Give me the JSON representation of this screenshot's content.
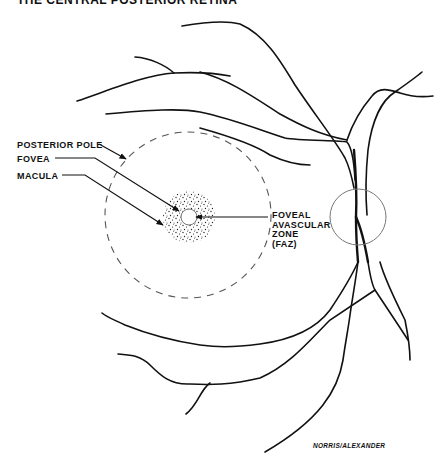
{
  "figure": {
    "title": "THE CENTRAL POSTERIOR RETINA",
    "credit": "NORRIS/ALEXANDER",
    "colors": {
      "ink": "#111111",
      "dash": "#555555",
      "disc": "#777777",
      "background": "#ffffff"
    }
  },
  "labels": {
    "posterior_pole": "POSTERIOR POLE",
    "fovea": "FOVEA",
    "macula": "MACULA",
    "faz": {
      "line1": "FOVEAL",
      "line2": "AVASCULAR",
      "line3": "ZONE",
      "line4": "(FAZ)"
    }
  },
  "structures": {
    "posterior_pole": {
      "shape": "dashed-circle",
      "cx": 188,
      "cy": 215,
      "r": 83
    },
    "macula": {
      "shape": "stippled-disc",
      "cx": 189,
      "cy": 217,
      "r": 26
    },
    "fovea_faz": {
      "shape": "clear-circle",
      "cx": 189,
      "cy": 217,
      "r": 8
    },
    "optic_disc": {
      "shape": "circle",
      "cx": 358,
      "cy": 217,
      "r": 28
    }
  }
}
